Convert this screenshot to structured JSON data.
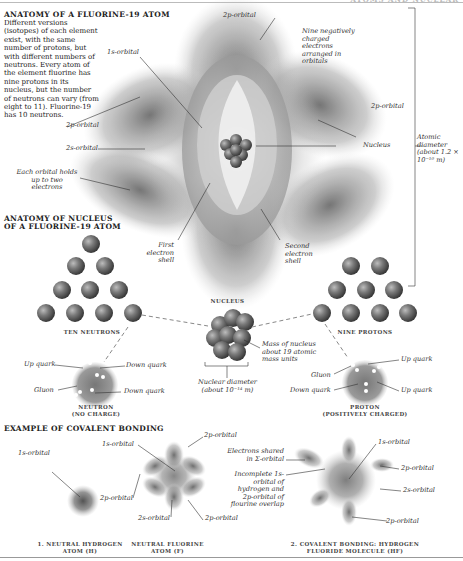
{
  "header": {
    "running_title": "ATOMS AND NUCLEAR"
  },
  "anatomy_atom": {
    "title": "Anatomy of a Fluorine-19 Atom",
    "description": "Different versions (isotopes) of each element exist, with the same number of protons, but with different numbers of neutrons. Every atom of the element fluorine has nine protons in its nucleus, but the number of neutrons can vary (from eight to 11). Fluorine-19 has 10 neutrons.",
    "labels": {
      "orbital_2p_top": "2p-orbital",
      "orbital_1s": "1s-orbital",
      "nine_electrons": "Nine negatively charged electrons arranged in orbitals",
      "orbital_2p_right": "2p-orbital",
      "orbital_2p_left": "2p-orbital",
      "orbital_2s": "2s-orbital",
      "nucleus": "Nucleus",
      "each_orbital": "Each orbital holds up to two electrons",
      "first_shell": "First electron shell",
      "second_shell": "Second electron shell",
      "atomic_diameter": "Atomic diameter (about 1.2 × 10⁻¹⁰ m)"
    }
  },
  "anatomy_nucleus": {
    "title_line1": "Anatomy of Nucleus",
    "title_line2": "of a Fluorine-19 Atom",
    "ten_neutrons": "Ten Neutrons",
    "nine_protons": "Nine Protons",
    "nucleus_label": "Nucleus",
    "mass_label": "Mass of nucleus about 19 atomic mass units",
    "nuclear_diameter": "Nuclear diameter (about 10⁻¹⁴ m)",
    "neutron": {
      "caption_line1": "Neutron",
      "caption_line2": "(No charge)",
      "up_quark": "Up quark",
      "down_quark_1": "Down quark",
      "gluon": "Gluon",
      "down_quark_2": "Down quark"
    },
    "proton": {
      "caption_line1": "Proton",
      "caption_line2": "(Positively charged)",
      "up_quark_1": "Up quark",
      "gluon": "Gluon",
      "down_quark": "Down quark",
      "up_quark_2": "Up quark"
    }
  },
  "covalent": {
    "title": "Example of Covalent Bonding",
    "hydrogen": {
      "orbital_1s": "1s-orbital",
      "caption_line1": "1. Neutral Hydrogen",
      "caption_line2": "Atom (H)"
    },
    "fluorine": {
      "orbital_1s": "1s-orbital",
      "orbital_2p_top": "2p-orbital",
      "orbital_2p_left": "2p-orbital",
      "orbital_2s": "2s-orbital",
      "orbital_2p_bottom": "2p-orbital",
      "caption_line1": "Neutral Fluorine",
      "caption_line2": "Atom (F)"
    },
    "hf": {
      "electrons_shared": "Electrons shared in Σ-orbital",
      "incomplete": "Incomplete 1s-orbital of hydrogen and 2p-orbital of flourine overlap",
      "orbital_1s": "1s-orbital",
      "orbital_2p_right": "2p-orbital",
      "orbital_2s": "2s-orbital",
      "orbital_2p_bottom": "2p-orbital",
      "caption_line1": "2. Covalent Bonding: Hydrogen",
      "caption_line2": "Fluoride Molecule (HF)"
    }
  },
  "colors": {
    "orbital_dark": "#5a5a5a",
    "orbital_light": "#d8d8d8",
    "particle": "#6e6e6e",
    "text": "#222222"
  }
}
